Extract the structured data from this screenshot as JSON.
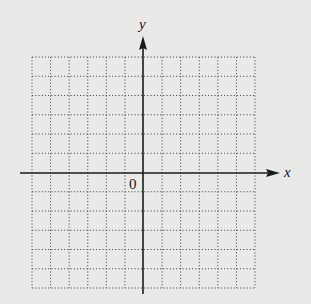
{
  "diagram": {
    "type": "coordinate-grid",
    "background": "#e9e9e7",
    "axis_color": "#1a1a1a",
    "grid_color": "#555555",
    "labels": {
      "x_axis": "x",
      "y_axis": "y",
      "origin": "0"
    },
    "grid": {
      "columns": 12,
      "rows": 12,
      "x_range": [
        -6,
        6
      ],
      "y_range": [
        -6,
        6
      ],
      "line_style": "dotted"
    }
  }
}
